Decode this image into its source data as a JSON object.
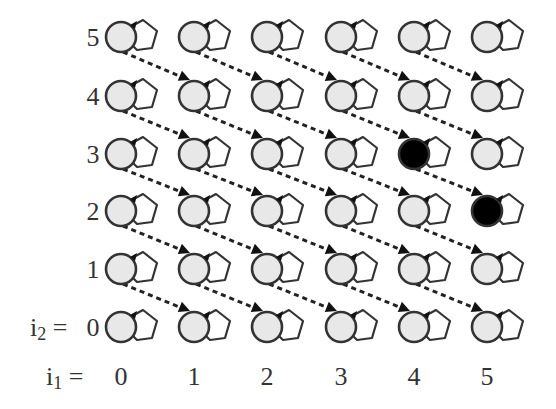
{
  "diagram": {
    "title": "",
    "row_axis_label": "i2 = ",
    "col_axis_label": "i1 = ",
    "row_labels": [
      "0",
      "1",
      "2",
      "3",
      "4",
      "5"
    ],
    "col_labels": [
      "0",
      "1",
      "2",
      "3",
      "4",
      "5"
    ],
    "grid": {
      "cols": 6,
      "rows": 6,
      "x_centers": [
        121,
        194,
        267,
        341,
        414,
        487
      ],
      "y_centers": [
        327,
        269,
        211,
        154,
        96,
        37
      ],
      "node_radius": 15
    },
    "colors": {
      "node_fill": "#e8e8e8",
      "node_highlight_fill": "#000000",
      "stroke": "#333333",
      "edge": "#222222",
      "text": "#333333"
    },
    "highlighted_nodes": [
      {
        "i1": 4,
        "i2": 3
      },
      {
        "i1": 5,
        "i2": 2
      }
    ],
    "edges_description": "Dashed arrows from node (i1, i2) to node (i1+1, i2-1); each node has a self-loop on its right side",
    "self_loops": true
  }
}
